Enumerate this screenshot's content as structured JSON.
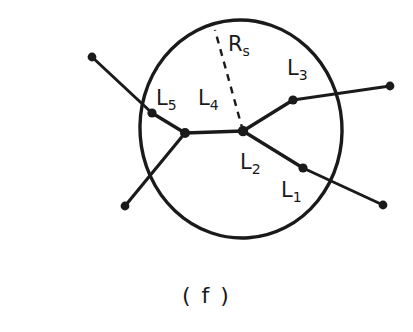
{
  "figure": {
    "caption": "( f )",
    "background_color": "#ffffff",
    "ink_color": "#1a1a1a",
    "circle": {
      "name": "sphere-boundary",
      "center_x": 241,
      "center_y": 129,
      "radius": 101,
      "stroke_width": 3.4
    },
    "radius_line": {
      "name": "radius-Rs",
      "style": "dashed",
      "x1": 243,
      "y1": 131,
      "x2": 215,
      "y2": 30,
      "dash": "7 6",
      "stroke_width": 2.4
    },
    "labels": [
      {
        "id": "Rs",
        "base": "R",
        "sub": "s",
        "x": 228,
        "y": 34
      },
      {
        "id": "L3",
        "base": "L",
        "sub": "3",
        "x": 287,
        "y": 58
      },
      {
        "id": "L5",
        "base": "L",
        "sub": "5",
        "x": 156,
        "y": 88
      },
      {
        "id": "L4",
        "base": "L",
        "sub": "4",
        "x": 198,
        "y": 88
      },
      {
        "id": "L2",
        "base": "L",
        "sub": "2",
        "x": 240,
        "y": 152
      },
      {
        "id": "L1",
        "base": "L",
        "sub": "1",
        "x": 281,
        "y": 180
      }
    ],
    "segments": [
      {
        "name": "segment-L5-outer",
        "points": [
          [
            92,
            57
          ],
          [
            152,
            113
          ]
        ],
        "stroke_width": 3.0
      },
      {
        "name": "segment-L5-inner",
        "points": [
          [
            152,
            113
          ],
          [
            185,
            133
          ]
        ],
        "stroke_width": 3.4
      },
      {
        "name": "segment-L4",
        "points": [
          [
            185,
            133
          ],
          [
            243,
            131
          ]
        ],
        "stroke_width": 3.4
      },
      {
        "name": "segment-lower-left-branch",
        "points": [
          [
            185,
            133
          ],
          [
            125,
            206
          ]
        ],
        "stroke_width": 3.2
      },
      {
        "name": "segment-L3-inner",
        "points": [
          [
            243,
            131
          ],
          [
            293,
            100
          ]
        ],
        "stroke_width": 3.4
      },
      {
        "name": "segment-L3-outer",
        "points": [
          [
            293,
            100
          ],
          [
            390,
            86
          ]
        ],
        "stroke_width": 3.0
      },
      {
        "name": "segment-L2",
        "points": [
          [
            243,
            131
          ],
          [
            303,
            168
          ]
        ],
        "stroke_width": 3.4
      },
      {
        "name": "segment-L1",
        "points": [
          [
            303,
            168
          ],
          [
            383,
            205
          ]
        ],
        "stroke_width": 3.0
      }
    ],
    "nodes": [
      {
        "name": "node-center-vertex",
        "x": 243,
        "y": 131,
        "r": 5.2
      },
      {
        "name": "node-left-vertex",
        "x": 185,
        "y": 133,
        "r": 5.0
      },
      {
        "name": "node-L5-junction",
        "x": 152,
        "y": 113,
        "r": 4.6
      },
      {
        "name": "node-L3-junction",
        "x": 293,
        "y": 100,
        "r": 4.6
      },
      {
        "name": "node-L1-junction",
        "x": 303,
        "y": 168,
        "r": 4.6
      },
      {
        "name": "endpoint-upper-left",
        "x": 92,
        "y": 57,
        "r": 4.4
      },
      {
        "name": "endpoint-lower-left",
        "x": 125,
        "y": 206,
        "r": 4.4
      },
      {
        "name": "endpoint-upper-right",
        "x": 390,
        "y": 86,
        "r": 4.4
      },
      {
        "name": "endpoint-lower-right",
        "x": 383,
        "y": 205,
        "r": 4.4
      }
    ]
  }
}
